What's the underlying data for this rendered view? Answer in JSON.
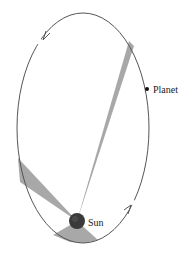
{
  "diagram": {
    "labels": {
      "planet": "Planet",
      "sun": "Sun"
    },
    "orbit": {
      "cx": 83,
      "cy": 128,
      "rx": 66,
      "ry": 115,
      "stroke": "#555555"
    },
    "sun": {
      "cx": 77,
      "cy": 221,
      "r": 8,
      "color": "#3a3a3a"
    },
    "planet": {
      "cx": 147,
      "cy": 89,
      "r": 2
    },
    "sectors_color": "#a8a8a8",
    "direction": "counterclockwise"
  }
}
